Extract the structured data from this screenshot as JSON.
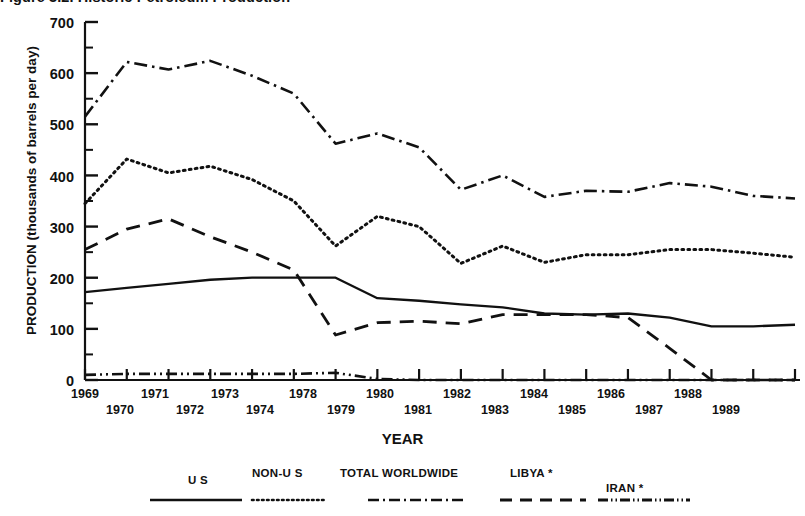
{
  "figure": {
    "title": "Figure 3.2. Historic Petroleum Production",
    "xlabel": "YEAR",
    "ylabel": "PRODUCTION (thousands of barrels per day)"
  },
  "axes": {
    "y_ticks": [
      "0",
      "100",
      "200",
      "300",
      "400",
      "500",
      "600",
      "700"
    ],
    "y_minor_ticks": [
      "50",
      "150",
      "250",
      "350",
      "450",
      "550",
      "650"
    ],
    "x_ticks_row1": [
      "1969",
      "1971",
      "1973",
      "1978",
      "1980",
      "1982",
      "1984",
      "1986",
      "1988"
    ],
    "x_ticks_row2": [
      "1970",
      "1972",
      "1974",
      "1979",
      "1981",
      "1983",
      "1985",
      "1987",
      "1989"
    ]
  },
  "legend": {
    "entries": [
      {
        "label": "U S",
        "style": "solid"
      },
      {
        "label": "NON-U S",
        "style": "dotted"
      },
      {
        "label": "TOTAL WORLDWIDE",
        "style": "dash-dot"
      },
      {
        "label": "LIBYA *",
        "style": "dashed"
      },
      {
        "label": "IRAN *",
        "style": "dash-dot-dot"
      }
    ]
  },
  "chart_data": {
    "type": "line",
    "title": "Figure 3.2. Historic Petroleum Production",
    "xlabel": "YEAR",
    "ylabel": "PRODUCTION (thousands of barrels per day)",
    "xlim": [
      1969,
      1989
    ],
    "ylim": [
      0,
      700
    ],
    "grid": false,
    "legend_position": "below-axes",
    "x": [
      1969,
      1970,
      1971,
      1972,
      1973,
      1974,
      1978,
      1979,
      1980,
      1981,
      1982,
      1983,
      1984,
      1985,
      1986,
      1987,
      1988,
      1989
    ],
    "series": [
      {
        "name": "TOTAL WORLDWIDE",
        "style": "dash-dot",
        "values": [
          515,
          622,
          607,
          624,
          595,
          560,
          462,
          482,
          455,
          372,
          400,
          358,
          370,
          368,
          385,
          378,
          360,
          355
        ]
      },
      {
        "name": "NON-U S",
        "style": "dotted",
        "values": [
          345,
          432,
          405,
          418,
          392,
          350,
          262,
          320,
          300,
          228,
          262,
          230,
          245,
          245,
          255,
          255,
          248,
          240
        ]
      },
      {
        "name": "LIBYA *",
        "style": "dashed",
        "values": [
          255,
          295,
          315,
          280,
          250,
          215,
          88,
          112,
          115,
          110,
          128,
          128,
          128,
          122,
          62,
          0,
          0,
          0
        ]
      },
      {
        "name": "U S",
        "style": "solid",
        "values": [
          172,
          180,
          188,
          196,
          200,
          200,
          200,
          160,
          155,
          148,
          142,
          130,
          128,
          130,
          122,
          105,
          105,
          108
        ]
      },
      {
        "name": "IRAN *",
        "style": "dash-dot-dot",
        "values": [
          10,
          12,
          12,
          12,
          12,
          12,
          14,
          2,
          0,
          0,
          0,
          0,
          0,
          0,
          0,
          0,
          0,
          0
        ]
      }
    ],
    "footnote_marker": "*"
  }
}
